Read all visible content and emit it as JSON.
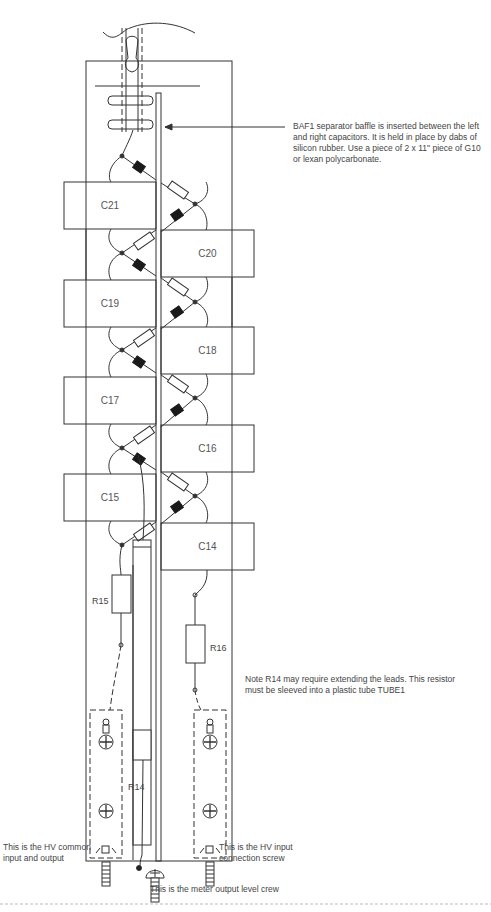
{
  "diagram": {
    "type": "assembly-layout",
    "capacitors": [
      {
        "id": "C21",
        "side": "left"
      },
      {
        "id": "C20",
        "side": "right"
      },
      {
        "id": "C19",
        "side": "left"
      },
      {
        "id": "C18",
        "side": "right"
      },
      {
        "id": "C17",
        "side": "left"
      },
      {
        "id": "C16",
        "side": "right"
      },
      {
        "id": "C15",
        "side": "left"
      },
      {
        "id": "C14",
        "side": "right"
      }
    ],
    "resistors": [
      {
        "id": "R15"
      },
      {
        "id": "R16"
      },
      {
        "id": "R14"
      }
    ],
    "annotations": {
      "baffle": "BAF1 separator baffle is inserted between the left and right capacitors.  It is held in place by dabs of silicon rubber.  Use a piece of 2 x 11\" piece of G10 or lexan polycarbonate.",
      "r14_note": "Note R14 may require extending the leads. This resistor must be sleeved into a plastic tube TUBE1",
      "hv_common": "This is the HV common input and output",
      "hv_input": "This is the HV input connection screw",
      "meter_output": "This is the meter output level crew"
    },
    "colors": {
      "line": "#333333",
      "diode_fill": "#1a1a1a",
      "text": "#444444"
    }
  }
}
